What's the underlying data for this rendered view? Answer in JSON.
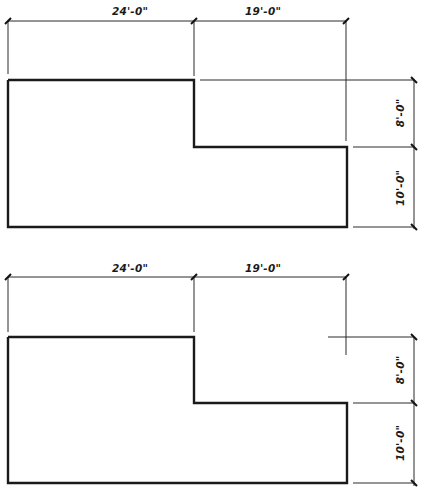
{
  "drawings": [
    {
      "name": "plan-version-1",
      "dimensions": {
        "horizontal": [
          {
            "label": "24'-0\"",
            "feet": 24
          },
          {
            "label": "19'-0\"",
            "feet": 19
          }
        ],
        "vertical": [
          {
            "label": "8'-0\"",
            "feet": 8
          },
          {
            "label": "10'-0\"",
            "feet": 10
          }
        ]
      },
      "shape": "L-shaped outline (stepped)"
    },
    {
      "name": "plan-version-2",
      "dimensions": {
        "horizontal": [
          {
            "label": "24'-0\"",
            "feet": 24
          },
          {
            "label": "19'-0\"",
            "feet": 19
          }
        ],
        "vertical": [
          {
            "label": "8'-0\"",
            "feet": 8
          },
          {
            "label": "10'-0\"",
            "feet": 10
          }
        ]
      },
      "shape": "L-shaped outline (stepped)"
    }
  ],
  "colors": {
    "line": "#1a1a1a",
    "background": "#ffffff"
  }
}
